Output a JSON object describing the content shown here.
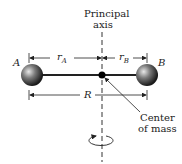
{
  "diagram": {
    "axis_label_line1": "Principal",
    "axis_label_line2": "axis",
    "mass_a_label": "A",
    "mass_b_label": "B",
    "r_a_label": "r",
    "r_a_sub": "A",
    "r_b_label": "r",
    "r_b_sub": "B",
    "R_label": "R",
    "com_label_line1": "Center",
    "com_label_line2": "of mass"
  }
}
